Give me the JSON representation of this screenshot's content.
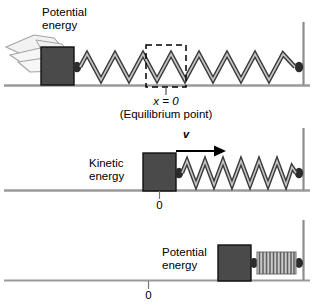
{
  "figure": {
    "colors": {
      "block_fill": "#4a4a4a",
      "block_stroke": "#111111",
      "spring_dark": "#3a3a3a",
      "spring_light": "#b9b9b9",
      "ground_line": "#9a9a9a",
      "wall_line": "#8d8d8d",
      "text": "#000000",
      "hand_fill": "#f2f2f2",
      "hand_stroke": "#9b9b9b",
      "dashed_box": "#000000",
      "coil_fill": "#c9c9c9"
    }
  },
  "panels": [
    {
      "id": "panel-stretched",
      "energy_label": "Potential\nenergy",
      "has_hand": true,
      "has_dashed_box": true,
      "spring_state": "stretched",
      "markers": [
        {
          "text": "x = 0",
          "sub": ""
        },
        {
          "text": "(Equilibrium point)",
          "sub": ""
        }
      ],
      "equilibrium_label_x": "x = 0",
      "equilibrium_label_caption": "(Equilibrium point)"
    },
    {
      "id": "panel-moving",
      "energy_label": "Kinetic\nenergy",
      "velocity_symbol": "v",
      "has_velocity_arrow": true,
      "spring_state": "relaxed",
      "origin_label": "0"
    },
    {
      "id": "panel-compressed",
      "energy_label": "Potential\nenergy",
      "spring_state": "compressed",
      "origin_label": "0"
    }
  ]
}
